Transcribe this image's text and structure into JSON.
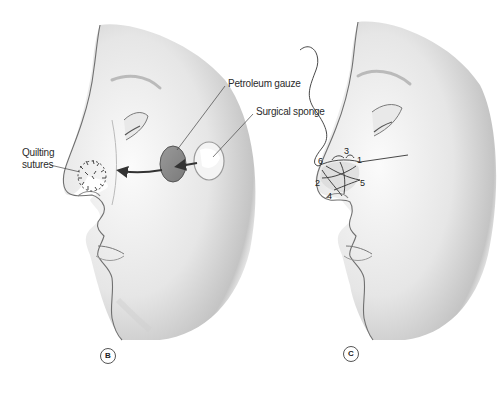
{
  "figure": {
    "panels": [
      {
        "id": "B",
        "badge": "B",
        "labels": {
          "quilting_line1": "Quilting",
          "quilting_line2": "sutures",
          "petroleum_gauze": "Petroleum gauze",
          "surgical_sponge": "Surgical sponge"
        }
      },
      {
        "id": "C",
        "badge": "C",
        "suture_points": [
          "1",
          "2",
          "3",
          "4",
          "5",
          "6"
        ]
      }
    ],
    "colors": {
      "background": "#ffffff",
      "skin_light": "#f4f4f4",
      "skin_shadow": "#bdbdbd",
      "outline": "#6e6e6e",
      "gauze": "#8c8c8c",
      "sponge": "#f2f2f2",
      "label_text": "#2b2b2b"
    }
  }
}
